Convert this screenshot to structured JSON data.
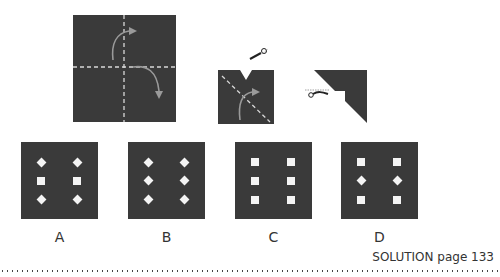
{
  "puzzle": {
    "step1": {
      "description": "square folded along dashed lines",
      "arrows": 2,
      "fold_lines": [
        "vertical",
        "horizontal"
      ]
    },
    "step2": {
      "description": "folded square with V notch cut at top, diagonal fold",
      "scissors_icon": "scissors-icon"
    },
    "step3": {
      "description": "triangle with stepped corner cut",
      "scissors_icon": "scissors-icon"
    }
  },
  "options": [
    {
      "label": "A",
      "holes": [
        "diamond",
        "diamond",
        "square",
        "square",
        "diamond",
        "diamond"
      ]
    },
    {
      "label": "B",
      "holes": [
        "diamond",
        "diamond",
        "diamond",
        "diamond",
        "diamond",
        "diamond"
      ]
    },
    {
      "label": "C",
      "holes": [
        "square",
        "square",
        "square",
        "square",
        "square",
        "square"
      ]
    },
    {
      "label": "D",
      "holes": [
        "square",
        "square",
        "diamond",
        "diamond",
        "square",
        "square"
      ]
    }
  ],
  "footer": {
    "solution_text": "SOLUTION page 133"
  },
  "colors": {
    "paper": "#3a3a3a",
    "hole": "#f4f4f4",
    "fold_line": "#d8d8d8",
    "arrow": "#9a9a9a"
  }
}
